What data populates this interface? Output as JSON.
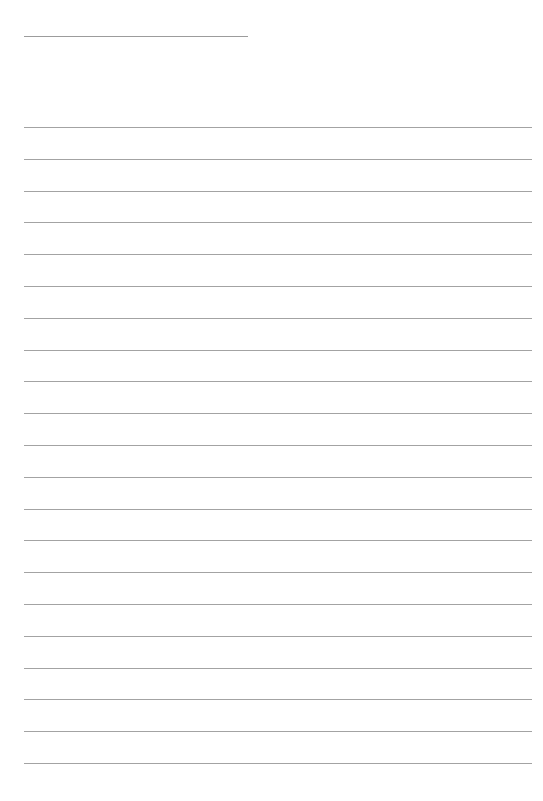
{
  "page": {
    "type": "blank-lined-paper",
    "background": "#ffffff",
    "line_color": "#a3a3a3",
    "title_line": {
      "x": 24,
      "y": 36,
      "width": 224
    },
    "ruled_lines": {
      "count": 21,
      "x": 24,
      "width": 508,
      "first_y": 127,
      "spacing": 31.8
    }
  }
}
